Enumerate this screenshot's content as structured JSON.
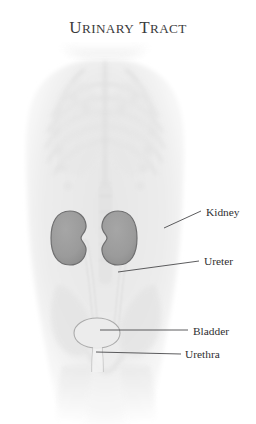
{
  "figure": {
    "title_words": [
      {
        "initial": "U",
        "rest": "RINARY"
      },
      {
        "initial": "T",
        "rest": "RACT"
      }
    ],
    "background_color": "#ffffff"
  },
  "colors": {
    "title_text": "#3b3b3d",
    "label_text": "#2f2f31",
    "leader_line": "#4a4a4c",
    "kidney_fill": "#9b9b9b",
    "kidney_outline": "#6f6f70",
    "torso_fill": "#ececec",
    "bone_fill": "#e2e2e2",
    "organ_outline": "#a8a8a8"
  },
  "labels": [
    {
      "id": "kidney",
      "text": "Kidney",
      "x": 206,
      "y": 216,
      "leader": {
        "x1": 164,
        "y1": 228,
        "x2": 201,
        "y2": 211
      }
    },
    {
      "id": "ureter",
      "text": "Ureter",
      "x": 204,
      "y": 265,
      "leader": {
        "x1": 118,
        "y1": 272,
        "x2": 199,
        "y2": 261
      }
    },
    {
      "id": "bladder",
      "text": "Bladder",
      "x": 193,
      "y": 335,
      "leader": {
        "x1": 100,
        "y1": 330,
        "x2": 188,
        "y2": 330
      }
    },
    {
      "id": "urethra",
      "text": "Urethra",
      "x": 185,
      "y": 358,
      "leader": {
        "x1": 96,
        "y1": 352,
        "x2": 181,
        "y2": 354
      }
    }
  ],
  "anatomy": {
    "kidney_left": {
      "cx": 70,
      "cy": 238,
      "rx": 17,
      "ry": 27
    },
    "kidney_right": {
      "cx": 118,
      "cy": 238,
      "rx": 17,
      "ry": 27
    },
    "bladder": {
      "cx": 97,
      "cy": 333,
      "rx": 23,
      "ry": 15
    },
    "urethra": {
      "x": 92,
      "y": 348,
      "w": 10,
      "h": 22
    }
  }
}
